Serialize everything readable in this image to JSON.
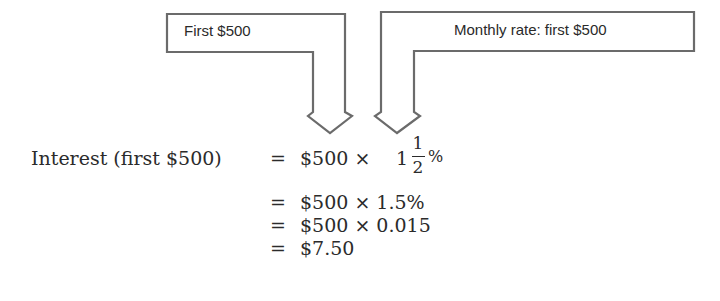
{
  "callouts": [
    {
      "id": "left",
      "label": "First $500"
    },
    {
      "id": "right",
      "label": "Monthly rate: first $500"
    }
  ],
  "equation": {
    "lhs": "Interest (first $500)",
    "line1": {
      "eq": "=",
      "term": "$500 ×",
      "whole": "1",
      "numerator": "1",
      "denominator": "2",
      "unit": "%"
    },
    "lines": [
      {
        "eq": "=",
        "expr": "$500 × 1.5%"
      },
      {
        "eq": "=",
        "expr": "$500 × 0.015"
      },
      {
        "eq": "=",
        "expr": "$7.50"
      }
    ]
  },
  "colors": {
    "outline": "#6b6b6b",
    "text": "#2b2b2b"
  }
}
